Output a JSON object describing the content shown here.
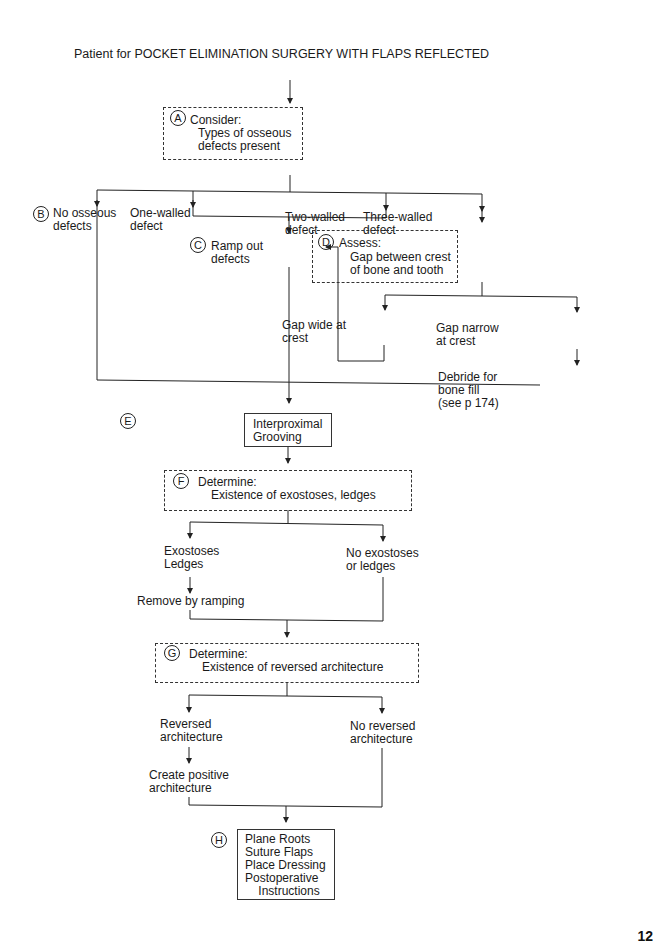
{
  "title": "Patient for POCKET ELIMINATION SURGERY WITH FLAPS REFLECTED",
  "nodes": {
    "A": {
      "letter": "A",
      "heading": "Consider:",
      "text": "Types of osseous\ndefects present"
    },
    "B": {
      "letter": "B",
      "text": "No osseous\ndefects"
    },
    "one_walled": {
      "text": "One-walled\ndefect"
    },
    "two_walled": {
      "text": "Two-walled\ndefect"
    },
    "three_walled": {
      "text": "Three-walled\ndefect"
    },
    "C": {
      "letter": "C",
      "text": "Ramp out\ndefects"
    },
    "D": {
      "letter": "D",
      "heading": "Assess:",
      "text": "Gap between crest\nof bone and tooth"
    },
    "gap_wide": {
      "text": "Gap wide at\ncrest"
    },
    "gap_narrow": {
      "text": "Gap narrow\nat crest"
    },
    "debride": {
      "text": "Debride for\nbone fill\n(see p 174)"
    },
    "E": {
      "letter": "E",
      "text": "Interproximal\nGrooving"
    },
    "F": {
      "letter": "F",
      "heading": "Determine:",
      "text": "Existence of exostoses, ledges"
    },
    "exostoses": {
      "text": "Exostoses\nLedges"
    },
    "no_exostoses": {
      "text": "No exostoses\nor ledges"
    },
    "remove": {
      "text": "Remove by ramping"
    },
    "G": {
      "letter": "G",
      "heading": "Determine:",
      "text": "Existence of reversed architecture"
    },
    "reversed": {
      "text": "Reversed\narchitecture"
    },
    "no_reversed": {
      "text": "No reversed\narchitecture"
    },
    "create_positive": {
      "text": "Create positive\narchitecture"
    },
    "H": {
      "letter": "H",
      "text": "Plane Roots\nSuture Flaps\nPlace Dressing\nPostoperative\n    Instructions"
    }
  },
  "page_number": "12"
}
